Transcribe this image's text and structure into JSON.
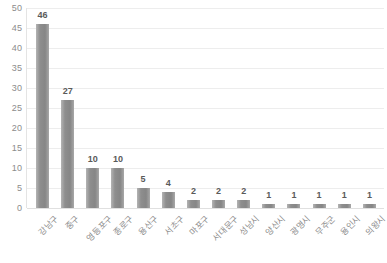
{
  "chart_data": {
    "type": "bar",
    "title": "",
    "subtitle": "",
    "xlabel": "",
    "ylabel": "",
    "categories": [
      "강남구",
      "중구",
      "영등포구",
      "종로구",
      "용산구",
      "서초구",
      "마포구",
      "서대문구",
      "성남시",
      "양산시",
      "광명시",
      "무주군",
      "용인시",
      "의왕시"
    ],
    "values": [
      46,
      27,
      10,
      10,
      5,
      4,
      2,
      2,
      2,
      1,
      1,
      1,
      1,
      1
    ],
    "ylim": [
      0,
      50
    ],
    "yticks": [
      0,
      5,
      10,
      15,
      20,
      25,
      30,
      35,
      40,
      45,
      50
    ],
    "ytick_labels": [
      "0",
      "5",
      "10",
      "15",
      "20",
      "25",
      "30",
      "35",
      "40",
      "45",
      "50"
    ],
    "data_labels": [
      "46",
      "27",
      "10",
      "10",
      "5",
      "4",
      "2",
      "2",
      "2",
      "1",
      "1",
      "1",
      "1",
      "1"
    ],
    "grid": true,
    "legend": false,
    "legend_position": "none",
    "bar_color": "#8c8c8c",
    "grid_color": "#ededed",
    "background_color": "#ffffff",
    "tick_label_color": "#8c8c8c",
    "data_label_color": "#5a5a5a"
  }
}
